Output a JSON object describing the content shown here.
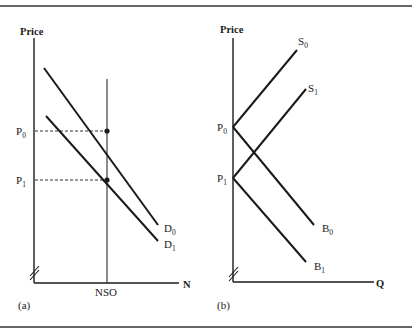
{
  "figure": {
    "panels": [
      {
        "id": "a",
        "caption": "(a)",
        "y_axis_label": "Price",
        "x_axis_label": "N",
        "vertical_line_label": "NSO",
        "price_levels": [
          {
            "base": "P",
            "sub": "0"
          },
          {
            "base": "P",
            "sub": "1"
          }
        ],
        "curves": [
          {
            "base": "D",
            "sub": "0"
          },
          {
            "base": "D",
            "sub": "1"
          }
        ]
      },
      {
        "id": "b",
        "caption": "(b)",
        "y_axis_label": "Price",
        "x_axis_label": "Q",
        "price_levels": [
          {
            "base": "P",
            "sub": "0"
          },
          {
            "base": "P",
            "sub": "1"
          }
        ],
        "curves": [
          {
            "base": "S",
            "sub": "0"
          },
          {
            "base": "S",
            "sub": "1"
          },
          {
            "base": "B",
            "sub": "0"
          },
          {
            "base": "B",
            "sub": "1"
          }
        ]
      }
    ]
  },
  "colors": {
    "ink": "#1a1a1a",
    "background": "#ffffff"
  }
}
